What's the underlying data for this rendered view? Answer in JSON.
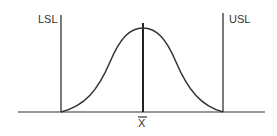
{
  "diagram": {
    "labels": {
      "lsl": "LSL",
      "usl": "USL",
      "mean": "X"
    },
    "colors": {
      "stroke": "#333333",
      "background": "#ffffff"
    }
  }
}
